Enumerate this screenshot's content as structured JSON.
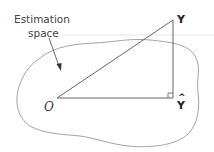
{
  "diagram": {
    "callout": {
      "line1": "Estimation",
      "line2": "space"
    },
    "points": {
      "origin": "O",
      "observed": "Y",
      "estimate": "Y",
      "estimate_hat": "^"
    },
    "colors": {
      "stroke": "#555555",
      "blob": "#999999",
      "text": "#333333"
    }
  }
}
